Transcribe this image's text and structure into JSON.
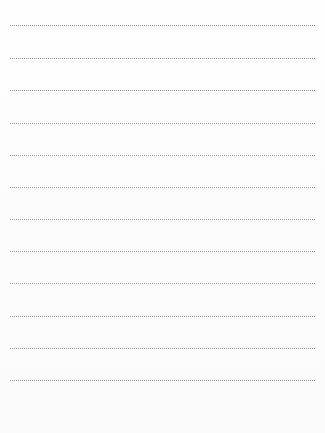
{
  "document": {
    "type": "lined-paper",
    "ruled_lines": [
      {
        "y": 25
      },
      {
        "y": 58
      },
      {
        "y": 90
      },
      {
        "y": 123
      },
      {
        "y": 155
      },
      {
        "y": 187
      },
      {
        "y": 219
      },
      {
        "y": 251
      },
      {
        "y": 283
      },
      {
        "y": 316
      },
      {
        "y": 348
      },
      {
        "y": 380
      }
    ],
    "line_color": "#9a9a9a",
    "background_color": "#fdfdfd"
  }
}
